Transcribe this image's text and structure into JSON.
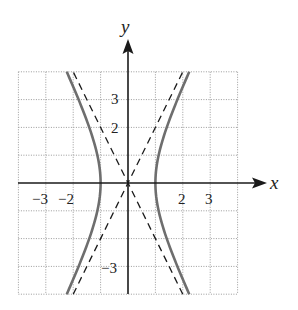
{
  "figure": {
    "type": "hyperbola-graph",
    "axis_labels": {
      "x": "x",
      "y": "y"
    },
    "x_tick_labels": [
      {
        "value": -3,
        "text": "−3"
      },
      {
        "value": -2,
        "text": "−2"
      },
      {
        "value": 2,
        "text": "2"
      },
      {
        "value": 3,
        "text": "3"
      }
    ],
    "y_tick_labels": [
      {
        "value": 3,
        "text": "3"
      },
      {
        "value": 2,
        "text": "2"
      },
      {
        "value": -3,
        "text": "−3"
      }
    ],
    "grid": {
      "x_range": [
        -4,
        4
      ],
      "y_range": [
        -4,
        4
      ],
      "step": 1,
      "style": "dotted"
    },
    "curve": {
      "equation": "x^2 - y^2/4 = 1",
      "vertices": [
        [
          -1,
          0
        ],
        [
          1,
          0
        ]
      ],
      "color": "#6e6e6e"
    },
    "asymptotes": [
      {
        "equation": "y = 2x",
        "style": "dashed"
      },
      {
        "equation": "y = -2x",
        "style": "dashed"
      }
    ]
  },
  "colors": {
    "grid": "#9a9a9a",
    "axis": "#1a1a1a",
    "curve": "#6e6e6e",
    "asymptote": "#1a1a1a"
  }
}
